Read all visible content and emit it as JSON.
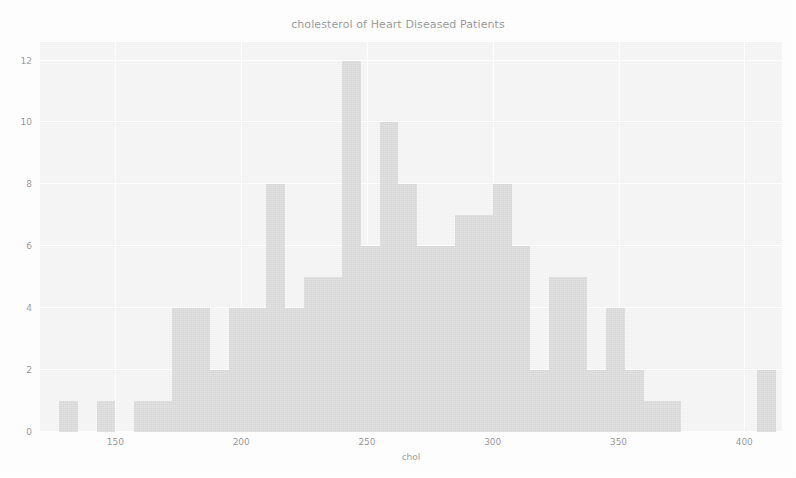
{
  "chart_data": {
    "type": "bar",
    "title": "cholesterol of Heart Diseased Patients",
    "xlabel": "chol",
    "ylabel": "",
    "grid": true,
    "legend": "none",
    "xlim": [
      120,
      415
    ],
    "ylim": [
      0,
      12.6
    ],
    "xticks": [
      "150",
      "200",
      "250",
      "300",
      "350",
      "400"
    ],
    "xtick_values": [
      150,
      200,
      250,
      300,
      350,
      400
    ],
    "yticks": [
      "0",
      "2",
      "4",
      "6",
      "8",
      "10",
      "12"
    ],
    "ytick_values": [
      0,
      2,
      4,
      6,
      8,
      10,
      12
    ],
    "bin_width": 7.5,
    "bar_color": "#c8c8c8",
    "plot_background": "#f0f0f0",
    "figure_background": "#ffffff",
    "text_color": "#5b5b5b",
    "bins": [
      {
        "x0": 127.5,
        "x1": 135.0,
        "count": 1
      },
      {
        "x0": 135.0,
        "x1": 142.5,
        "count": 0
      },
      {
        "x0": 142.5,
        "x1": 150.0,
        "count": 1
      },
      {
        "x0": 150.0,
        "x1": 157.5,
        "count": 0
      },
      {
        "x0": 157.5,
        "x1": 165.0,
        "count": 1
      },
      {
        "x0": 165.0,
        "x1": 172.5,
        "count": 1
      },
      {
        "x0": 172.5,
        "x1": 180.0,
        "count": 4
      },
      {
        "x0": 180.0,
        "x1": 187.5,
        "count": 4
      },
      {
        "x0": 187.5,
        "x1": 195.0,
        "count": 2
      },
      {
        "x0": 195.0,
        "x1": 202.5,
        "count": 4
      },
      {
        "x0": 202.5,
        "x1": 210.0,
        "count": 4
      },
      {
        "x0": 210.0,
        "x1": 217.5,
        "count": 8
      },
      {
        "x0": 217.5,
        "x1": 225.0,
        "count": 4
      },
      {
        "x0": 225.0,
        "x1": 232.5,
        "count": 5
      },
      {
        "x0": 232.5,
        "x1": 240.0,
        "count": 5
      },
      {
        "x0": 240.0,
        "x1": 247.5,
        "count": 12
      },
      {
        "x0": 247.5,
        "x1": 255.0,
        "count": 6
      },
      {
        "x0": 255.0,
        "x1": 262.5,
        "count": 10
      },
      {
        "x0": 262.5,
        "x1": 270.0,
        "count": 8
      },
      {
        "x0": 270.0,
        "x1": 277.5,
        "count": 6
      },
      {
        "x0": 277.5,
        "x1": 285.0,
        "count": 6
      },
      {
        "x0": 285.0,
        "x1": 292.5,
        "count": 7
      },
      {
        "x0": 292.5,
        "x1": 300.0,
        "count": 7
      },
      {
        "x0": 300.0,
        "x1": 307.5,
        "count": 8
      },
      {
        "x0": 307.5,
        "x1": 315.0,
        "count": 6
      },
      {
        "x0": 315.0,
        "x1": 322.5,
        "count": 2
      },
      {
        "x0": 322.5,
        "x1": 330.0,
        "count": 5
      },
      {
        "x0": 330.0,
        "x1": 337.5,
        "count": 5
      },
      {
        "x0": 337.5,
        "x1": 345.0,
        "count": 2
      },
      {
        "x0": 345.0,
        "x1": 352.5,
        "count": 4
      },
      {
        "x0": 352.5,
        "x1": 360.0,
        "count": 2
      },
      {
        "x0": 360.0,
        "x1": 367.5,
        "count": 1
      },
      {
        "x0": 367.5,
        "x1": 375.0,
        "count": 1
      },
      {
        "x0": 375.0,
        "x1": 382.5,
        "count": 0
      },
      {
        "x0": 382.5,
        "x1": 390.0,
        "count": 0
      },
      {
        "x0": 390.0,
        "x1": 397.5,
        "count": 0
      },
      {
        "x0": 397.5,
        "x1": 405.0,
        "count": 0
      },
      {
        "x0": 405.0,
        "x1": 412.5,
        "count": 2
      }
    ]
  }
}
